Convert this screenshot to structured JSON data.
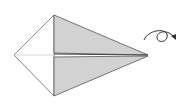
{
  "diagram": {
    "type": "origami-step",
    "colors": {
      "outline": "#555555",
      "shade": "#d4d4d4",
      "paper": "#ffffff",
      "crease": "#cccccc"
    },
    "points": {
      "left_tip": [
        14,
        55
      ],
      "top": [
        54,
        15
      ],
      "bottom": [
        54,
        96
      ],
      "right_tip": [
        148,
        55
      ],
      "center": [
        54,
        55
      ]
    },
    "symbols": [
      {
        "name": "turn-over-arrow",
        "position": [
          158,
          36
        ]
      }
    ]
  }
}
